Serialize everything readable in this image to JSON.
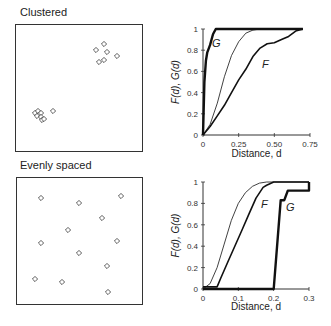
{
  "panels": {
    "clustered": {
      "title": "Clustered",
      "points": [
        [
          96,
          50
        ],
        [
          104,
          44
        ],
        [
          107,
          52
        ],
        [
          117,
          56
        ],
        [
          99,
          62
        ],
        [
          104,
          60
        ],
        [
          35,
          113
        ],
        [
          38,
          111
        ],
        [
          41,
          113
        ],
        [
          37,
          116
        ],
        [
          41,
          117
        ],
        [
          42,
          120
        ],
        [
          44,
          119
        ],
        [
          53,
          111
        ]
      ]
    },
    "evenly": {
      "title": "Evenly spaced",
      "points": [
        [
          41,
          198
        ],
        [
          79,
          203
        ],
        [
          121,
          196
        ],
        [
          102,
          218
        ],
        [
          68,
          230
        ],
        [
          41,
          243
        ],
        [
          117,
          241
        ],
        [
          79,
          253
        ],
        [
          107,
          266
        ],
        [
          35,
          279
        ],
        [
          62,
          282
        ],
        [
          108,
          292
        ]
      ]
    }
  },
  "chart_data": [
    {
      "type": "line",
      "name": "clustered-distance-functions",
      "xlabel": "Distance, d",
      "ylabel": "F(d), G(d)",
      "xlim": [
        0,
        0.75
      ],
      "ylim": [
        0,
        1
      ],
      "xticks": [
        "0",
        "0.25",
        "0.50",
        "0.75"
      ],
      "yticks": [
        "0",
        "0.2",
        "0.4",
        "0.6",
        "0.8",
        "1"
      ],
      "grid": false,
      "series": [
        {
          "name": "G",
          "style": "thick",
          "x": [
            0,
            0.01,
            0.02,
            0.03,
            0.05,
            0.07,
            0.09,
            0.7
          ],
          "y": [
            0,
            0.5,
            0.7,
            0.78,
            0.85,
            0.95,
            1,
            1
          ]
        },
        {
          "name": "theoretical",
          "style": "thin",
          "x": [
            0,
            0.05,
            0.1,
            0.15,
            0.2,
            0.25,
            0.3,
            0.35,
            0.4,
            0.7
          ],
          "y": [
            0,
            0.1,
            0.3,
            0.55,
            0.75,
            0.88,
            0.96,
            0.99,
            1,
            1
          ]
        },
        {
          "name": "F",
          "style": "medium",
          "x": [
            0,
            0.05,
            0.1,
            0.15,
            0.2,
            0.25,
            0.3,
            0.35,
            0.4,
            0.45,
            0.5,
            0.55,
            0.6,
            0.65,
            0.7
          ],
          "y": [
            0,
            0.08,
            0.18,
            0.28,
            0.4,
            0.52,
            0.62,
            0.74,
            0.82,
            0.86,
            0.87,
            0.9,
            0.93,
            0.98,
            1
          ]
        }
      ],
      "labels": {
        "G": "G",
        "F": "F"
      }
    },
    {
      "type": "line",
      "name": "evenly-spaced-distance-functions",
      "xlabel": "Distance, d",
      "ylabel": "F(d), G(d)",
      "xlim": [
        0,
        0.3
      ],
      "ylim": [
        0,
        1
      ],
      "xticks": [
        "0",
        "0.1",
        "0.2",
        "0.3"
      ],
      "yticks": [
        "0",
        "0.2",
        "0.4",
        "0.6",
        "0.8",
        "1"
      ],
      "grid": false,
      "series": [
        {
          "name": "theoretical",
          "style": "thin",
          "x": [
            0,
            0.02,
            0.04,
            0.06,
            0.08,
            0.1,
            0.12,
            0.14,
            0.16,
            0.18,
            0.2,
            0.3
          ],
          "y": [
            0,
            0.05,
            0.2,
            0.42,
            0.64,
            0.8,
            0.9,
            0.96,
            0.99,
            1,
            1,
            1
          ]
        },
        {
          "name": "F",
          "style": "medium",
          "x": [
            0,
            0.04,
            0.05,
            0.07,
            0.09,
            0.11,
            0.13,
            0.15,
            0.17,
            0.18,
            0.2,
            0.3
          ],
          "y": [
            0.02,
            0.02,
            0.1,
            0.25,
            0.4,
            0.55,
            0.7,
            0.85,
            0.95,
            0.97,
            1,
            1
          ]
        },
        {
          "name": "G",
          "style": "thick",
          "x": [
            0,
            0.2,
            0.22,
            0.23,
            0.24,
            0.25,
            0.28,
            0.28,
            0.3,
            0.3
          ],
          "y": [
            0,
            0,
            0.83,
            0.83,
            0.92,
            0.92,
            0.92,
            0.92,
            0.92,
            1
          ]
        }
      ],
      "labels": {
        "G": "G",
        "F": "F"
      }
    }
  ]
}
